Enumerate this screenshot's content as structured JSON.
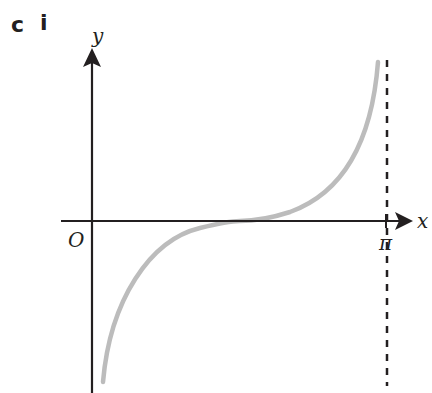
{
  "question_label": {
    "part": "c",
    "subpart": "i"
  },
  "diagram": {
    "type": "function-graph",
    "axes": {
      "x_label": "x",
      "y_label": "y",
      "origin_label": "O",
      "x_tick_label": "π"
    },
    "asymptote": {
      "x": "π",
      "style": "dashed"
    },
    "curve": {
      "description": "tan-shaped curve, inflection at x = π/2 on x-axis, vertical asymptotes at x = 0 and x = π",
      "color": "#bcbcbc"
    },
    "colors": {
      "axis": "#231f20",
      "curve": "#bcbcbc",
      "asymptote": "#231f20"
    }
  }
}
